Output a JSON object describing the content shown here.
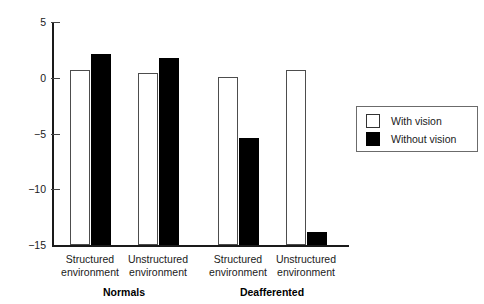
{
  "chart_data": {
    "type": "bar",
    "title": "",
    "subtitle": "",
    "xlabel": "",
    "ylabel": "",
    "ylim": [
      -15,
      5
    ],
    "yticks": [
      5,
      0,
      -5,
      -10,
      -15
    ],
    "ytick_labels": [
      "5",
      "0",
      "−5",
      "−10",
      "−15"
    ],
    "grid": false,
    "legend_position": "right",
    "categories": [
      "Structured environment",
      "Unstructured environment",
      "Structured environment",
      "Unstructured environment"
    ],
    "category_lines": [
      [
        "Structured",
        "environment"
      ],
      [
        "Unstructured",
        "environment"
      ],
      [
        "Structured",
        "environment"
      ],
      [
        "Unstructured",
        "environment"
      ]
    ],
    "groups": [
      {
        "label": "Normals",
        "categories": [
          0,
          1
        ]
      },
      {
        "label": "Deafferented",
        "categories": [
          2,
          3
        ]
      }
    ],
    "series": [
      {
        "name": "With vision",
        "color": "#ffffff",
        "edge_color": "#4d4d4d",
        "values": [
          0.7,
          0.4,
          0.05,
          0.7
        ]
      },
      {
        "name": "Without vision",
        "color": "#000000",
        "edge_color": "#000000",
        "values": [
          2.1,
          1.8,
          -5.4,
          -13.8
        ]
      }
    ]
  },
  "legend": {
    "entries": [
      {
        "label": "With vision",
        "swatch": "white"
      },
      {
        "label": "Without vision",
        "swatch": "black"
      }
    ]
  }
}
